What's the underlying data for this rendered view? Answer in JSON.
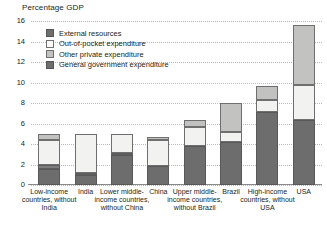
{
  "chart_data": {
    "type": "bar",
    "title": "Percentage GDP",
    "ylabel": "Percentage GDP",
    "xlabel": "",
    "ylim": [
      0,
      16
    ],
    "yticks": [
      0,
      2,
      4,
      6,
      8,
      10,
      12,
      14,
      16
    ],
    "ytick_labels": [
      "0",
      "2",
      "4",
      "6",
      "8",
      "10",
      "12",
      "14",
      "16"
    ],
    "grid": true,
    "stacked": true,
    "legend_position": "upper-left-inside",
    "categories": [
      "Low-income countries, without India",
      "India",
      "Lower middle-income countries, without China",
      "China",
      "Upper middle-income countries, without Brazil",
      "Brazil",
      "High-income countries, without USA",
      "USA"
    ],
    "series": [
      {
        "name": "General government expenditure",
        "color": "#6d6d6d",
        "values": [
          1.6,
          1.0,
          2.9,
          1.9,
          3.8,
          4.2,
          7.1,
          6.3
        ]
      },
      {
        "name": "External resources",
        "color": "#7d7d7d",
        "values": [
          0.4,
          0.15,
          0.25,
          0.0,
          0.0,
          0.0,
          0.0,
          0.0
        ]
      },
      {
        "name": "Out-of-pocket expenditure",
        "color": "#f2f2f0",
        "values": [
          2.4,
          3.75,
          1.85,
          2.5,
          1.9,
          1.0,
          1.2,
          3.5
        ]
      },
      {
        "name": "Other private expenditure",
        "color": "#c2c2c0",
        "values": [
          0.6,
          0.0,
          0.0,
          0.3,
          0.6,
          2.8,
          1.4,
          5.8
        ]
      }
    ],
    "totals": [
      5.0,
      4.9,
      5.0,
      4.7,
      6.3,
      8.0,
      9.7,
      15.6
    ]
  },
  "legend": {
    "items": [
      {
        "label": "External resources",
        "swatch": "ext"
      },
      {
        "label": "Out-of-pocket expenditure",
        "swatch": "oop"
      },
      {
        "label": "Other private expenditure",
        "swatch": "oth"
      },
      {
        "label": "General government expenditure",
        "swatch": "gov"
      }
    ]
  }
}
